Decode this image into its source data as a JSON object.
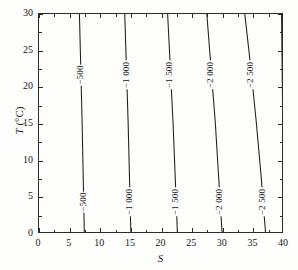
{
  "chart_data": {
    "type": "line",
    "title": "",
    "subtitle": "",
    "xlabel": "S",
    "ylabel": "T (°C)",
    "ylabel_symbol": "T",
    "ylabel_unit": "(°C)",
    "xlim": [
      0,
      40
    ],
    "ylim": [
      0,
      30
    ],
    "xticks": [
      0,
      5,
      10,
      15,
      20,
      25,
      30,
      35,
      40
    ],
    "xticklabels": [
      "0",
      "5",
      "10",
      "15",
      "20",
      "25",
      "30",
      "35",
      "40"
    ],
    "xminorticks": [
      2.5,
      7.5,
      12.5,
      17.5,
      22.5,
      27.5,
      32.5,
      37.5
    ],
    "yticks": [
      0,
      5,
      10,
      15,
      20,
      25,
      30
    ],
    "yticklabels": [
      "0",
      "5",
      "10",
      "15",
      "20",
      "25",
      "30"
    ],
    "yminorticks": [
      2.5,
      7.5,
      12.5,
      17.5,
      22.5,
      27.5
    ],
    "grid": false,
    "legend": "none",
    "line_color": "#1d1d1d",
    "background_color": "#fdfdfc",
    "axis_color": "#2b2b2b",
    "contours": [
      {
        "label": "−500",
        "level": -500,
        "x_at_T0": 7.4,
        "x_at_T30": 6.6,
        "label_positions": [
          {
            "T": 21.5,
            "x": 6.85
          },
          {
            "T": 4.2,
            "x": 7.3
          }
        ]
      },
      {
        "label": "−1 000",
        "level": -1000,
        "x_at_T0": 15.0,
        "x_at_T30": 14.0,
        "label_positions": [
          {
            "T": 21.5,
            "x": 14.3
          },
          {
            "T": 4.2,
            "x": 14.85
          }
        ]
      },
      {
        "label": "−1 500",
        "level": -1500,
        "x_at_T0": 22.6,
        "x_at_T30": 21.0,
        "label_positions": [
          {
            "T": 21.5,
            "x": 21.45
          },
          {
            "T": 4.2,
            "x": 22.35
          }
        ]
      },
      {
        "label": "−2 000",
        "level": -2000,
        "x_at_T0": 29.9,
        "x_at_T30": 27.4,
        "label_positions": [
          {
            "T": 21.5,
            "x": 28.1
          },
          {
            "T": 4.2,
            "x": 29.5
          }
        ]
      },
      {
        "label": "−2 500",
        "level": -2500,
        "x_at_T0": 37.0,
        "x_at_T30": 33.6,
        "label_positions": [
          {
            "T": 21.5,
            "x": 34.6
          },
          {
            "T": 4.2,
            "x": 36.5
          }
        ]
      },
      {
        "label": "",
        "level": -3000,
        "x_at_T0": 40.0,
        "x_at_T30": 39.6,
        "label_positions": []
      }
    ]
  }
}
